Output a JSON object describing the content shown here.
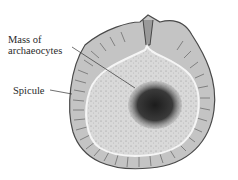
{
  "diagram": {
    "labels": [
      {
        "id": "mass",
        "lines": [
          "Mass of",
          "archaeocytes"
        ]
      },
      {
        "id": "spicule",
        "lines": [
          "Spicule"
        ]
      }
    ],
    "colors": {
      "outer_coat": "#bdbdbd",
      "inner_fill": "#d6d6d6",
      "mass": "#2b2b2b",
      "outline": "#444444"
    }
  }
}
